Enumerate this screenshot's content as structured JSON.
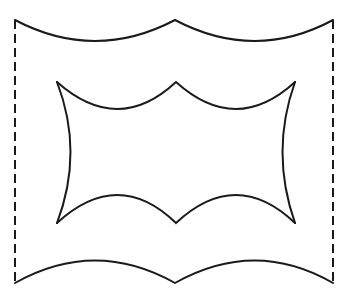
{
  "diagram": {
    "type": "line-drawing",
    "stroke_color": "#1a1a1a",
    "background": "#ffffff",
    "outer_shape": {
      "top_edge": "two concave arcs meeting at a center peak",
      "bottom_edge": "two convex arcs meeting at a center notch",
      "left_edge": "dashed vertical line",
      "right_edge": "dashed vertical line"
    },
    "inner_shape": {
      "top_edge": "two concave arcs meeting at a center peak",
      "bottom_edge": "two convex arcs meeting at a center notch",
      "left_edge": "concave curve bulging inward",
      "right_edge": "concave curve bulging inward"
    }
  }
}
